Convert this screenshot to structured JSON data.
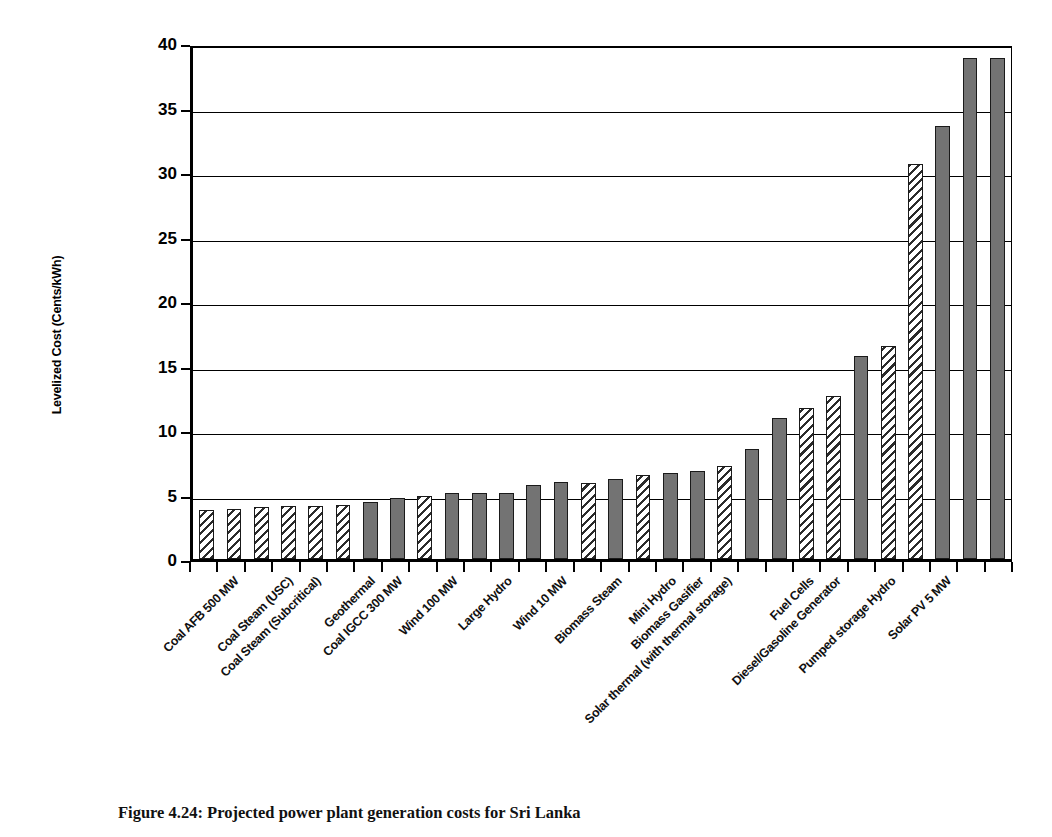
{
  "figure": {
    "caption": "Figure 4.24: Projected power plant generation costs for Sri Lanka",
    "ylabel": "Levelized Cost (Cents/kWh)"
  },
  "chart_data": {
    "type": "bar",
    "title": "",
    "xlabel": "",
    "ylabel": "Levelized Cost (Cents/kWh)",
    "ylim": [
      0,
      40
    ],
    "ytick_labels": [
      "0",
      "5",
      "10",
      "15",
      "20",
      "25",
      "30",
      "35",
      "40"
    ],
    "ytick_values": [
      0,
      5,
      10,
      15,
      20,
      25,
      30,
      35,
      40
    ],
    "grid": "horizontal",
    "legend": "none",
    "series_name": "Levelized Cost",
    "categories": [
      "Coal AFB 300 MW",
      "Coal AFB 500 MW",
      "Coal Steam (USC)",
      "Coal Steam (Supercritical)",
      "Coal Steam (Subcritical)",
      "Geothermal",
      "Coal IGCC 600 MW",
      "Coal IGCC 300 MW",
      "Wind 100 MW",
      "Wind 50 MW",
      "Large Hydro",
      "Wind 20 MW",
      "Wind 10 MW",
      "Biomass Steam",
      "Biomass Steam (small)",
      "Mini Hydro",
      "Micro Hydro",
      "Biomass Gasifier",
      "Biomass Gasifier (small)",
      "Solar thermal (with thermal storage)",
      "Solar thermal",
      "Fuel Cells",
      "Fuel Cells (small)",
      "Diesel/Gasoline Generator",
      "Diesel Generator (small)",
      "Pumped storage Hydro",
      "Solar PV 5 MW",
      "Solar PV (rooftop)"
    ],
    "values": [
      3.8,
      3.9,
      4.0,
      4.1,
      4.1,
      4.2,
      4.4,
      4.7,
      4.9,
      5.1,
      5.1,
      5.1,
      5.7,
      6.0,
      5.9,
      6.2,
      6.5,
      6.7,
      6.8,
      7.2,
      8.5,
      10.9,
      11.7,
      12.6,
      15.7,
      16.5,
      30.6,
      33.6
    ],
    "extra_values": [
      38.8,
      38.8
    ],
    "fill_patterns": [
      "hatch",
      "hatch",
      "hatch",
      "hatch",
      "hatch",
      "hatch",
      "solid",
      "solid",
      "hatch",
      "solid",
      "solid",
      "solid",
      "solid",
      "solid",
      "hatch",
      "solid",
      "hatch",
      "solid",
      "solid",
      "hatch",
      "solid",
      "solid",
      "hatch",
      "hatch",
      "solid",
      "hatch",
      "hatch",
      "solid"
    ],
    "visible_labels": [
      {
        "index": 1,
        "text": "Coal AFB 500 MW"
      },
      {
        "index": 3,
        "text": "Coal Steam (USC)"
      },
      {
        "index": 4,
        "text": "Coal Steam (Subcritical)"
      },
      {
        "index": 6,
        "text": "Geothermal"
      },
      {
        "index": 7,
        "text": "Coal IGCC 300 MW"
      },
      {
        "index": 9,
        "text": "Wind 100 MW"
      },
      {
        "index": 11,
        "text": "Large Hydro"
      },
      {
        "index": 13,
        "text": "Wind 10 MW"
      },
      {
        "index": 15,
        "text": "Biomass Steam"
      },
      {
        "index": 17,
        "text": "Mini Hydro"
      },
      {
        "index": 18,
        "text": "Biomass Gasifier"
      },
      {
        "index": 19,
        "text": "Solar thermal (with thermal storage)"
      },
      {
        "index": 22,
        "text": "Fuel Cells"
      },
      {
        "index": 23,
        "text": "Diesel/Gasoline Generator"
      },
      {
        "index": 25,
        "text": "Pumped storage Hydro"
      },
      {
        "index": 27,
        "text": "Solar PV 5 MW"
      }
    ],
    "colors": {
      "solid_fill": "#737373",
      "hatch_line": "#2b2b2b",
      "outline": "#1a1a1a",
      "axis": "#000000",
      "background": "#ffffff"
    }
  }
}
